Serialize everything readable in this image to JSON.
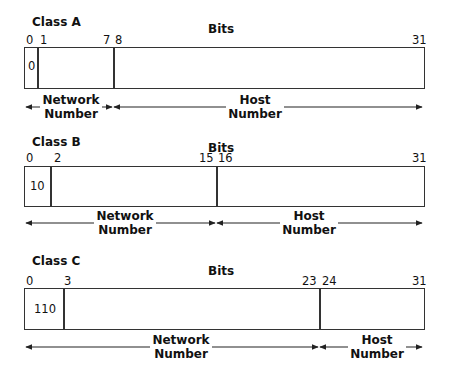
{
  "diagram": {
    "bits_label": "Bits",
    "classes": [
      {
        "name": "Class A",
        "ticks": [
          "0",
          "1",
          "7",
          "8",
          "31"
        ],
        "prefix": "0",
        "network_label": [
          "Network",
          "Number"
        ],
        "host_label": [
          "Host",
          "Number"
        ]
      },
      {
        "name": "Class B",
        "ticks": [
          "0",
          "2",
          "15",
          "16",
          "31"
        ],
        "prefix": "10",
        "network_label": [
          "Network",
          "Number"
        ],
        "host_label": [
          "Host",
          "Number"
        ]
      },
      {
        "name": "Class C",
        "ticks": [
          "0",
          "3",
          "23",
          "24",
          "31"
        ],
        "prefix": "110",
        "network_label": [
          "Network",
          "Number"
        ],
        "host_label": [
          "Host",
          "Number"
        ]
      }
    ]
  }
}
